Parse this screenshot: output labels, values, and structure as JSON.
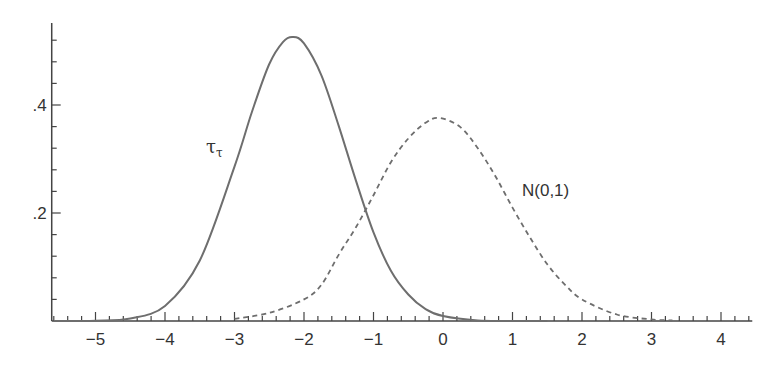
{
  "chart_data": {
    "type": "line",
    "title": "",
    "xlabel": "",
    "ylabel": "",
    "xlim": [
      -5.63,
      4.45
    ],
    "ylim": [
      0,
      0.55
    ],
    "grid": false,
    "legend": "none (inline curve labels)",
    "x_ticks": {
      "major": [
        -5,
        -4,
        -3,
        -2,
        -1,
        0,
        1,
        2,
        3,
        4
      ],
      "labels": [
        "−5",
        "−4",
        "−3",
        "−2",
        "−1",
        "0",
        "1",
        "2",
        "3",
        "4"
      ],
      "minor_step": 0.2
    },
    "y_ticks": {
      "major": [
        0.2,
        0.4
      ],
      "labels": [
        ".2",
        ".4"
      ],
      "minor_step": 0.04
    },
    "series": [
      {
        "name": "τ_τ",
        "label_main": "τ",
        "label_sub": "τ",
        "style": "solid",
        "color": "#6e6e6e",
        "peak": {
          "x": -2.16,
          "y": 0.526
        },
        "x": [
          -5.6,
          -5.0,
          -4.5,
          -4.0,
          -3.5,
          -3.0,
          -2.75,
          -2.5,
          -2.3,
          -2.16,
          -2.0,
          -1.75,
          -1.5,
          -1.25,
          -1.0,
          -0.75,
          -0.5,
          -0.25,
          0.0,
          0.5,
          1.0,
          1.5
        ],
        "values": [
          0.0,
          0.0005,
          0.0046,
          0.028,
          0.112,
          0.286,
          0.387,
          0.476,
          0.517,
          0.526,
          0.514,
          0.455,
          0.361,
          0.259,
          0.164,
          0.093,
          0.049,
          0.022,
          0.009,
          0.001,
          0.0001,
          0.0
        ]
      },
      {
        "name": "N(0,1)",
        "style": "dashed",
        "color": "#6e6e6e",
        "peak": {
          "x": -0.05,
          "y": 0.376
        },
        "x": [
          -3.0,
          -2.5,
          -2.0,
          -1.75,
          -1.5,
          -1.25,
          -1.0,
          -0.75,
          -0.5,
          -0.25,
          -0.05,
          0.25,
          0.5,
          0.75,
          1.0,
          1.25,
          1.5,
          1.75,
          2.0,
          2.5,
          3.0,
          3.3
        ],
        "values": [
          0.004,
          0.015,
          0.04,
          0.067,
          0.123,
          0.174,
          0.233,
          0.294,
          0.338,
          0.367,
          0.376,
          0.359,
          0.32,
          0.269,
          0.21,
          0.155,
          0.105,
          0.068,
          0.04,
          0.012,
          0.003,
          0.001
        ]
      }
    ],
    "annotations": [
      {
        "text": "τ_τ",
        "x": -3.45,
        "y": 0.33
      },
      {
        "text": "N(0,1)",
        "x": 1.15,
        "y": 0.235
      },
      {
        "text": "curves cross",
        "x": -1.15,
        "y": 0.19
      }
    ]
  },
  "labels": {
    "tau_main": "τ",
    "tau_sub": "τ",
    "normal": "N(0,1)"
  }
}
